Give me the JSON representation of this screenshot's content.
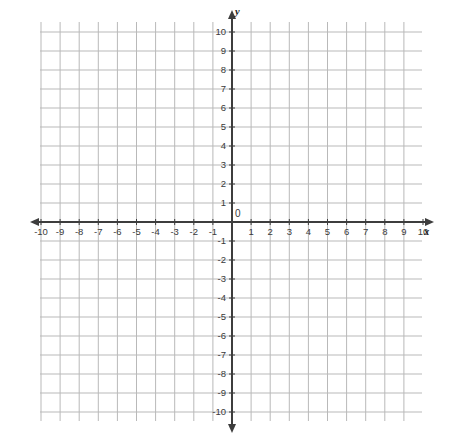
{
  "chart_data": {
    "type": "scatter",
    "title": "",
    "subtitle": "",
    "xlabel": "x",
    "ylabel": "y",
    "xlim": [
      -10.5,
      10.5
    ],
    "ylim": [
      -10.5,
      10.5
    ],
    "grid": true,
    "legend": null,
    "series": [],
    "x_ticks": [
      -10,
      -9,
      -8,
      -7,
      -6,
      -5,
      -4,
      -3,
      -2,
      -1,
      1,
      2,
      3,
      4,
      5,
      6,
      7,
      8,
      9,
      10
    ],
    "y_ticks": [
      10,
      9,
      8,
      7,
      6,
      5,
      4,
      3,
      2,
      1,
      -1,
      -2,
      -3,
      -4,
      -5,
      -6,
      -7,
      -8,
      -9,
      -10
    ],
    "x_tick_labels": [
      "-10",
      "-9",
      "-8",
      "-7",
      "-6",
      "-5",
      "-4",
      "-3",
      "-2",
      "-1",
      "1",
      "2",
      "3",
      "4",
      "5",
      "6",
      "7",
      "8",
      "9",
      "10"
    ],
    "y_tick_labels": [
      "10",
      "9",
      "8",
      "7",
      "6",
      "5",
      "4",
      "3",
      "2",
      "1",
      "-1",
      "-2",
      "-3",
      "-4",
      "-5",
      "-6",
      "-7",
      "-8",
      "-9",
      "-10"
    ],
    "origin_label": "0",
    "annotations": []
  },
  "axes": {
    "x_axis_name": "x",
    "y_axis_name": "y",
    "origin_label": "0"
  },
  "colors": {
    "background": "#ffffff",
    "gridline": "#b9b9b9",
    "axis": "#3d3d3d",
    "tick_text": "#3a3a3a",
    "axis_label": "#1d1d1d"
  },
  "geometry": {
    "grid_left": 40,
    "grid_right": 422,
    "grid_top": 22,
    "grid_bottom": 421,
    "origin_x": 232,
    "origin_y": 222,
    "cell_w": 19.1,
    "cell_h": 19.0
  }
}
